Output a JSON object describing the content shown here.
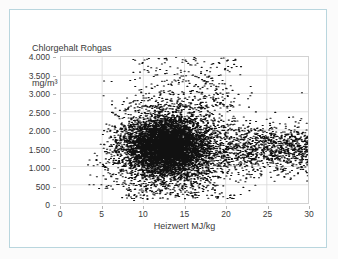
{
  "card": {
    "border_color": "#b9d6de",
    "background": "#ffffff"
  },
  "chart_data": {
    "type": "scatter",
    "title": "Chlorgehalt Rohgas",
    "title_line1": "Chlorgehalt Rohgas",
    "title_line2": "mg/m³",
    "ylabel": "Chlorgehalt Rohgas mg/m³",
    "xlabel": "Heizwert MJ/kg",
    "xlim": [
      0,
      30
    ],
    "ylim": [
      0,
      4000
    ],
    "grid": true,
    "legend": false,
    "marker_color": "#111111",
    "marker_size": 1.1,
    "xticks": [
      0,
      5,
      10,
      15,
      20,
      25,
      30
    ],
    "xtick_labels": [
      "0",
      "5",
      "10",
      "15",
      "20",
      "25",
      "30"
    ],
    "yticks": [
      0,
      500,
      1000,
      1500,
      2000,
      2500,
      3000,
      3500,
      4000
    ],
    "ytick_labels": [
      "0",
      "500",
      "1.000",
      "1.500",
      "2.000",
      "2.500",
      "3.000",
      "3.500",
      "4.000"
    ],
    "n_points": 9000,
    "cluster_center": [
      12.8,
      1550
    ],
    "cluster_spread": [
      2.4,
      380
    ],
    "tail_x_range": [
      16,
      30
    ],
    "tail_y_center": 1500,
    "outlier_y_max": 4000,
    "outlier_y_min": 100,
    "notable_outliers": [
      [
        29.2,
        3020
      ],
      [
        3.4,
        1180
      ],
      [
        3.9,
        1020
      ],
      [
        12.3,
        140
      ],
      [
        16.5,
        150
      ],
      [
        21.0,
        210
      ],
      [
        16.3,
        3950
      ],
      [
        10.4,
        3940
      ]
    ]
  }
}
